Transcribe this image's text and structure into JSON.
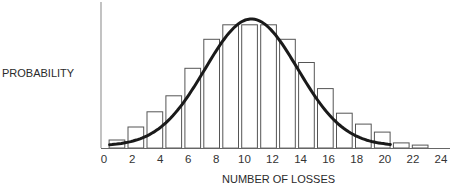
{
  "chart_data": {
    "type": "bar",
    "title": "",
    "xlabel": "NUMBER OF LOSSES",
    "ylabel": "PROBABILITY",
    "x_ticks": [
      0,
      2,
      4,
      6,
      8,
      10,
      12,
      14,
      16,
      18,
      20,
      22,
      24
    ],
    "xlim": [
      0,
      24
    ],
    "ylim": [
      0,
      1
    ],
    "grid": false,
    "legend": null,
    "bar_heights_normalized": [
      0.055,
      0.145,
      0.25,
      0.36,
      0.55,
      0.75,
      0.85,
      0.85,
      0.85,
      0.75,
      0.59,
      0.41,
      0.24,
      0.165,
      0.11,
      0.035,
      0.02
    ],
    "bar_count": 17,
    "bar_x_start": 0.36,
    "bar_x_step": 1.35,
    "bar_width_units": 1.12,
    "overlay_curve": {
      "type": "line",
      "description": "smooth bell-shaped (normal) fitted curve",
      "x_range": [
        0.4,
        20.4
      ],
      "peak_x": 10.5,
      "peak_normalized": 0.89,
      "sigma_units": 3.3
    }
  },
  "labels": {
    "y_axis": "PROBABILITY",
    "x_axis": "NUMBER OF LOSSES"
  }
}
